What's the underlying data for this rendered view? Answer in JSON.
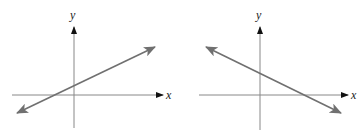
{
  "colors": {
    "axis": "#888888",
    "axis_arrow": "#111111",
    "line": "#707070",
    "background": "#ffffff"
  },
  "graphs": [
    {
      "name": "positive-slope",
      "x_label": "x",
      "y_label": "y",
      "x_axis": {
        "x1": 12,
        "x2": 163,
        "y": 95
      },
      "y_axis": {
        "x": 74,
        "y1": 128,
        "y2": 27
      },
      "x_label_pos": {
        "x": 166,
        "y": 99
      },
      "y_label_pos": {
        "x": 70,
        "y": 19
      },
      "line": {
        "x1": 17,
        "y1": 113,
        "x2": 155,
        "y2": 47
      }
    },
    {
      "name": "negative-slope",
      "x_label": "x",
      "y_label": "y",
      "x_axis": {
        "x1": 199,
        "x2": 348,
        "y": 95
      },
      "y_axis": {
        "x": 260,
        "y1": 130,
        "y2": 27
      },
      "x_label_pos": {
        "x": 351,
        "y": 99
      },
      "y_label_pos": {
        "x": 256,
        "y": 19
      },
      "line": {
        "x1": 206,
        "y1": 47,
        "x2": 341,
        "y2": 113
      }
    }
  ]
}
